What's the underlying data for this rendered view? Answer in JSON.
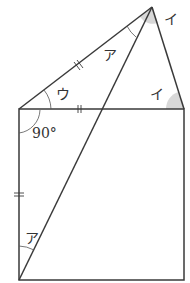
{
  "diagram": {
    "type": "geometry",
    "colors": {
      "stroke": "#3a3a3a",
      "shade": "#d8d8d8",
      "label": "#333333"
    },
    "points": {
      "A": [
        19,
        109
      ],
      "B": [
        184,
        109
      ],
      "C": [
        184,
        280
      ],
      "D": [
        19,
        280
      ],
      "E": [
        152,
        7
      ]
    },
    "labels": {
      "angle_a_top": "ア",
      "angle_i_apex": "イ",
      "angle_i_base": "イ",
      "angle_u": "ウ",
      "right_angle": "90°",
      "angle_a_bottom": "ア"
    },
    "tick_marks": [
      "AE",
      "AB",
      "AD"
    ]
  }
}
